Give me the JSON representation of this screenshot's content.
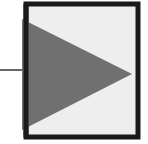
{
  "diagram": {
    "type": "block-symbol",
    "symbol": "triangle-right-in-box",
    "colors": {
      "background": "#ffffff",
      "box_fill": "#eeeeee",
      "box_border": "#1a1a1a",
      "triangle_fill": "#707070",
      "input_line": "#333333"
    },
    "box": {
      "x": 26,
      "y": 4,
      "width": 112,
      "height": 133,
      "border_width": 5
    },
    "triangle": {
      "points": "22,19 132,74 22,130"
    },
    "input_line": {
      "x1": 0,
      "y1": 70,
      "x2": 24,
      "y2": 70,
      "width": 1.5
    }
  }
}
